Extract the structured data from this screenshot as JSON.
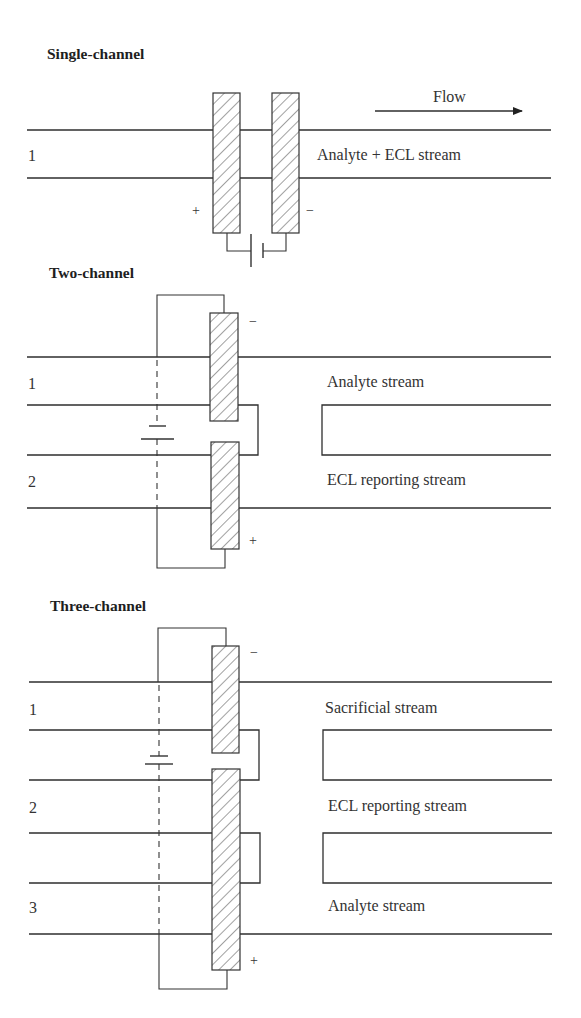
{
  "sections": {
    "single": {
      "title": "Single-channel",
      "flow_label": "Flow",
      "channel_numbers": [
        "1"
      ],
      "stream_labels": [
        "Analyte + ECL stream"
      ],
      "left_electrode_sign": "+",
      "right_electrode_sign": "−"
    },
    "two": {
      "title": "Two-channel",
      "channel_numbers": [
        "1",
        "2"
      ],
      "stream_labels": [
        "Analyte stream",
        "ECL reporting stream"
      ],
      "top_electrode_sign": "−",
      "bottom_electrode_sign": "+"
    },
    "three": {
      "title": "Three-channel",
      "channel_numbers": [
        "1",
        "2",
        "3"
      ],
      "stream_labels": [
        "Sacrificial stream",
        "ECL reporting stream",
        "Analyte stream"
      ],
      "top_electrode_sign": "−",
      "bottom_electrode_sign": "+"
    }
  },
  "colors": {
    "line": "#2e2e2e",
    "text": "#333333",
    "background": "#ffffff"
  }
}
